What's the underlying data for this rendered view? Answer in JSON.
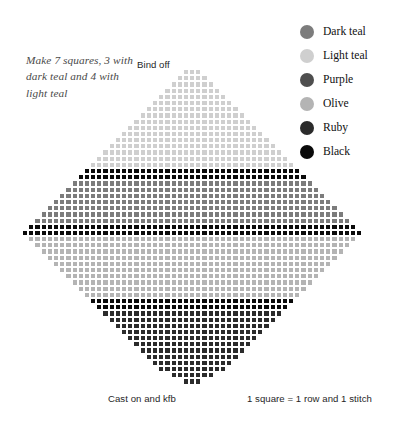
{
  "note": {
    "text": "Make 7 squares, 3 with dark teal and 4 with light teal"
  },
  "labels": {
    "bind_off": "Bind off",
    "cast_on": "Cast on and kfb",
    "gauge": "1 square = 1 row and 1 stitch"
  },
  "legend": {
    "items": [
      {
        "label": "Dark teal",
        "color": "#7c7c7c"
      },
      {
        "label": "Light teal",
        "color": "#cfcfcf"
      },
      {
        "label": "Purple",
        "color": "#4e4e4e"
      },
      {
        "label": "Olive",
        "color": "#b4b4b4"
      },
      {
        "label": "Ruby",
        "color": "#2b2b2b"
      },
      {
        "label": "Black",
        "color": "#0a0a0a"
      }
    ]
  },
  "chart_data": {
    "type": "heatmap",
    "xlabel": "stitches",
    "ylabel": "rows",
    "cell_px": 6.2,
    "columns": 55,
    "rows": 51,
    "grid_on": true,
    "legend_position": "top-right",
    "palette": {
      "dark_teal": "#7c7c7c",
      "light_teal": "#cfcfcf",
      "purple": "#4e4e4e",
      "olive": "#b4b4b4",
      "ruby": "#2b2b2b",
      "black": "#0a0a0a",
      "empty": "transparent"
    },
    "band_plan": [
      {
        "name": "light teal",
        "key": "light_teal",
        "row_start": 0,
        "row_end": 15
      },
      {
        "name": "black",
        "key": "black",
        "row_start": 16,
        "row_end": 17
      },
      {
        "name": "dark teal",
        "key": "dark_teal",
        "row_start": 18,
        "row_end": 24
      },
      {
        "name": "black",
        "key": "black",
        "row_start": 25,
        "row_end": 26
      },
      {
        "name": "olive",
        "key": "olive",
        "row_start": 27,
        "row_end": 36
      },
      {
        "name": "black",
        "key": "black",
        "row_start": 37,
        "row_end": 38
      },
      {
        "name": "ruby",
        "key": "ruby",
        "row_start": 39,
        "row_end": 50
      }
    ],
    "shape": "diamond",
    "shape_note": "Row i width grows by 2 per row to the middle row, then shrinks by 2 per row; rows centered on 55 columns.",
    "rows_spec": [
      {
        "row": 0,
        "start": 26,
        "width": 3,
        "key": "light_teal"
      },
      {
        "row": 1,
        "start": 25,
        "width": 5,
        "key": "light_teal"
      },
      {
        "row": 2,
        "start": 24,
        "width": 7,
        "key": "light_teal"
      },
      {
        "row": 3,
        "start": 23,
        "width": 9,
        "key": "light_teal"
      },
      {
        "row": 4,
        "start": 22,
        "width": 11,
        "key": "light_teal"
      },
      {
        "row": 5,
        "start": 21,
        "width": 13,
        "key": "light_teal"
      },
      {
        "row": 6,
        "start": 20,
        "width": 15,
        "key": "light_teal"
      },
      {
        "row": 7,
        "start": 19,
        "width": 17,
        "key": "light_teal"
      },
      {
        "row": 8,
        "start": 18,
        "width": 19,
        "key": "light_teal"
      },
      {
        "row": 9,
        "start": 17,
        "width": 21,
        "key": "light_teal"
      },
      {
        "row": 10,
        "start": 16,
        "width": 23,
        "key": "light_teal"
      },
      {
        "row": 11,
        "start": 15,
        "width": 25,
        "key": "light_teal"
      },
      {
        "row": 12,
        "start": 14,
        "width": 27,
        "key": "light_teal"
      },
      {
        "row": 13,
        "start": 13,
        "width": 29,
        "key": "light_teal"
      },
      {
        "row": 14,
        "start": 12,
        "width": 31,
        "key": "light_teal"
      },
      {
        "row": 15,
        "start": 11,
        "width": 33,
        "key": "light_teal"
      },
      {
        "row": 16,
        "start": 10,
        "width": 35,
        "key": "black"
      },
      {
        "row": 17,
        "start": 9,
        "width": 37,
        "key": "black"
      },
      {
        "row": 18,
        "start": 8,
        "width": 39,
        "key": "dark_teal"
      },
      {
        "row": 19,
        "start": 7,
        "width": 41,
        "key": "dark_teal"
      },
      {
        "row": 20,
        "start": 6,
        "width": 43,
        "key": "dark_teal"
      },
      {
        "row": 21,
        "start": 5,
        "width": 45,
        "key": "dark_teal"
      },
      {
        "row": 22,
        "start": 4,
        "width": 47,
        "key": "dark_teal"
      },
      {
        "row": 23,
        "start": 3,
        "width": 49,
        "key": "dark_teal"
      },
      {
        "row": 24,
        "start": 2,
        "width": 51,
        "key": "dark_teal"
      },
      {
        "row": 25,
        "start": 1,
        "width": 53,
        "key": "black"
      },
      {
        "row": 26,
        "start": 0,
        "width": 55,
        "key": "black"
      },
      {
        "row": 27,
        "start": 1,
        "width": 53,
        "key": "olive"
      },
      {
        "row": 28,
        "start": 2,
        "width": 51,
        "key": "olive"
      },
      {
        "row": 29,
        "start": 3,
        "width": 49,
        "key": "olive"
      },
      {
        "row": 30,
        "start": 4,
        "width": 47,
        "key": "olive"
      },
      {
        "row": 31,
        "start": 5,
        "width": 45,
        "key": "olive"
      },
      {
        "row": 32,
        "start": 6,
        "width": 43,
        "key": "olive"
      },
      {
        "row": 33,
        "start": 7,
        "width": 41,
        "key": "olive"
      },
      {
        "row": 34,
        "start": 8,
        "width": 39,
        "key": "olive"
      },
      {
        "row": 35,
        "start": 9,
        "width": 37,
        "key": "olive"
      },
      {
        "row": 36,
        "start": 10,
        "width": 35,
        "key": "olive"
      },
      {
        "row": 37,
        "start": 11,
        "width": 33,
        "key": "black"
      },
      {
        "row": 38,
        "start": 12,
        "width": 31,
        "key": "black"
      },
      {
        "row": 39,
        "start": 13,
        "width": 29,
        "key": "ruby"
      },
      {
        "row": 40,
        "start": 14,
        "width": 27,
        "key": "ruby"
      },
      {
        "row": 41,
        "start": 15,
        "width": 25,
        "key": "ruby"
      },
      {
        "row": 42,
        "start": 16,
        "width": 23,
        "key": "ruby"
      },
      {
        "row": 43,
        "start": 17,
        "width": 21,
        "key": "ruby"
      },
      {
        "row": 44,
        "start": 18,
        "width": 19,
        "key": "ruby"
      },
      {
        "row": 45,
        "start": 19,
        "width": 17,
        "key": "ruby"
      },
      {
        "row": 46,
        "start": 20,
        "width": 15,
        "key": "ruby"
      },
      {
        "row": 47,
        "start": 21,
        "width": 13,
        "key": "ruby"
      },
      {
        "row": 48,
        "start": 22,
        "width": 11,
        "key": "ruby"
      },
      {
        "row": 49,
        "start": 24,
        "width": 7,
        "key": "ruby"
      },
      {
        "row": 50,
        "start": 26,
        "width": 3,
        "key": "ruby"
      }
    ]
  }
}
